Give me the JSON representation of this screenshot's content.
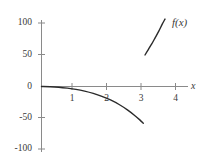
{
  "chart_data": {
    "type": "line",
    "title": "",
    "subtitle": "",
    "xlabel": "x",
    "ylabel": "",
    "xlim": [
      -0.25,
      4.6
    ],
    "ylim": [
      -115,
      118
    ],
    "grid": false,
    "legend_position": "inline-right",
    "x_ticks": [
      1,
      2,
      3,
      4
    ],
    "x_tick_labels": [
      "1",
      "2",
      "3",
      "4"
    ],
    "y_ticks": [
      -100,
      -50,
      0,
      50,
      100
    ],
    "y_tick_labels": [
      "-100",
      "-50",
      "0",
      "50",
      "100"
    ],
    "annotations": [
      {
        "text": "f(x)",
        "x": 3.75,
        "y": 88
      }
    ],
    "series": [
      {
        "name": "f(x)",
        "color": "#2a2a2a",
        "branch": "left",
        "x": [
          0,
          0.25,
          0.5,
          0.75,
          1,
          1.25,
          1.5,
          1.75,
          2,
          2.25,
          2.5,
          2.7,
          2.85,
          2.95
        ],
        "values": [
          0,
          -0.3,
          -1.1,
          -2.6,
          -4.6,
          -7.4,
          -11.0,
          -15.6,
          -21.4,
          -28.6,
          -37.5,
          -46.0,
          -53.0,
          -58.5
        ]
      },
      {
        "name": "f(x)",
        "color": "#2a2a2a",
        "branch": "right",
        "x": [
          3.0,
          3.1,
          3.2,
          3.3,
          3.4,
          3.5,
          3.58
        ],
        "values": [
          50,
          59,
          68,
          78,
          88,
          99,
          107
        ]
      }
    ],
    "axis_color": "#6e6e6e",
    "curve_color": "#2a2a2a",
    "background": "#ffffff"
  },
  "labels": {
    "x_axis": "x",
    "function_label": "f(x)",
    "y_100": "100",
    "y_50": "50",
    "y_0": "0",
    "y_neg50": "-50",
    "y_neg100": "-100",
    "x_1": "1",
    "x_2": "2",
    "x_3": "3",
    "x_4": "4"
  }
}
